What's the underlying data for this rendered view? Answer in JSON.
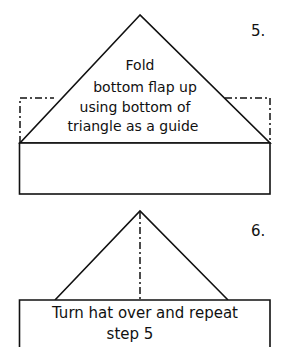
{
  "steps": [
    {
      "number": "5.",
      "instruction_lines": [
        "Fold",
        "bottom flap up",
        "using bottom of",
        "triangle as a guide"
      ]
    },
    {
      "number": "6.",
      "instruction_lines": [
        "Turn hat over and repeat",
        "step 5"
      ]
    }
  ],
  "colors": {
    "line": "#111111",
    "background": "#ffffff"
  }
}
